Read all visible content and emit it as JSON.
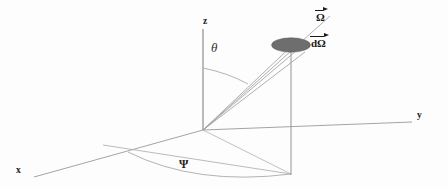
{
  "figure": {
    "background_color": "#fdfdfd",
    "line_color": "#8c8c8c",
    "disk_fill_color": "#6e6e6e",
    "text_color": "#1a1a1a"
  },
  "axes": [
    {
      "name": "z-axis",
      "label": "z",
      "direction": "up",
      "x": 205,
      "y": 21
    },
    {
      "name": "y-axis",
      "label": "y",
      "direction": "right",
      "x": 417,
      "y": 116
    },
    {
      "name": "x-axis",
      "label": "x",
      "direction": "lower-left",
      "x": 17,
      "y": 167
    }
  ],
  "angles": [
    {
      "name": "polar-angle",
      "label": "θ",
      "symbol_name": "theta",
      "x": 213,
      "y": 47
    },
    {
      "name": "azimuthal-angle",
      "label": "Ψ",
      "symbol_name": "psi",
      "x": 180,
      "y": 157
    }
  ],
  "vectors": [
    {
      "name": "omega-vector",
      "label": "Ω",
      "symbol_name": "Omega",
      "accent": "vector-arrow-overline",
      "x": 318,
      "y": 10
    },
    {
      "name": "d-omega-vector",
      "label": "dΩ",
      "symbol_name": "d-Omega",
      "accent": "vector-arrow-overline",
      "x": 313,
      "y": 36
    }
  ],
  "elements": [
    {
      "name": "solid-angle-disk",
      "shape": "ellipse",
      "cx": 291,
      "cy": 45,
      "rx": 19,
      "ry": 7,
      "fill": "#6e6e6e"
    },
    {
      "name": "origin-point",
      "x": 203,
      "y": 130
    },
    {
      "name": "cone-rays",
      "count": 4,
      "from": "origin",
      "to": "solid-angle-disk"
    },
    {
      "name": "projection-drop-line",
      "from_x": 291,
      "from_y": 45,
      "to_x": 291,
      "to_y": 174
    },
    {
      "name": "ground-plane-arc",
      "description": "azimuthal arc in xy-plane"
    }
  ]
}
